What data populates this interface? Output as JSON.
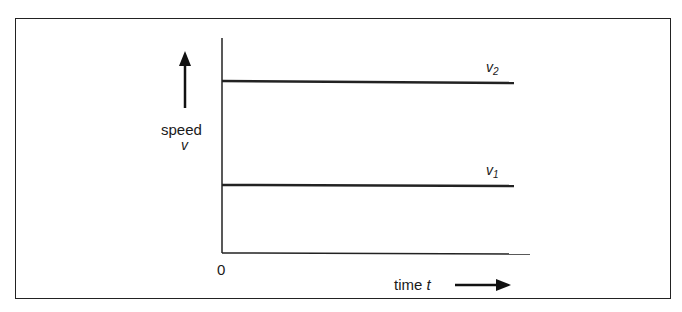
{
  "diagram": {
    "y_axis_label": "speed",
    "y_axis_symbol": "v",
    "x_axis_label": "time",
    "x_axis_symbol": "t",
    "origin_label": "0",
    "lines": [
      {
        "name": "v",
        "subscript": "2",
        "level": "high"
      },
      {
        "name": "v",
        "subscript": "1",
        "level": "low"
      }
    ]
  }
}
